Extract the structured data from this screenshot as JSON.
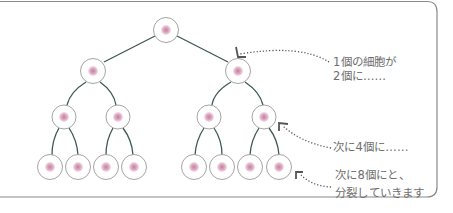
{
  "diagram": {
    "colors": {
      "border": "#8a8a8a",
      "branch": "#3e5a4a",
      "cell_outline": "#9a9a9a",
      "nucleus": "#d9a3bd",
      "nucleus_core": "#c57ea2",
      "arrow": "#555555",
      "text": "#6e6e6e"
    },
    "levels": [
      {
        "count": 1,
        "cells": [
          [
            166,
            30
          ]
        ]
      },
      {
        "count": 2,
        "cells": [
          [
            93,
            71
          ],
          [
            238,
            71
          ]
        ]
      },
      {
        "count": 4,
        "cells": [
          [
            64,
            117
          ],
          [
            118,
            117
          ],
          [
            209,
            117
          ],
          [
            264,
            117
          ]
        ]
      },
      {
        "count": 8,
        "cells": [
          [
            50,
            167
          ],
          [
            78,
            167
          ],
          [
            106,
            167
          ],
          [
            134,
            167
          ],
          [
            194,
            167
          ],
          [
            222,
            167
          ],
          [
            250,
            167
          ],
          [
            279,
            167
          ]
        ]
      }
    ],
    "annotations": [
      {
        "line1": "1個の細胞が",
        "line2": "2個に……"
      },
      {
        "line1": "次に4個に……"
      },
      {
        "line1": "次に8個にと、",
        "line2": "分裂していきます"
      }
    ]
  }
}
